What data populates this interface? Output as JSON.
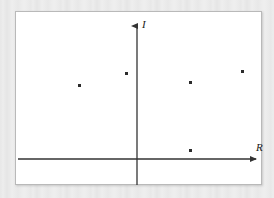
{
  "figure": {
    "kind": "complex-plane-scatter",
    "background_color": "#ebebeb",
    "panel_color": "#ffffff",
    "panel_border_color": "#b9b9b9",
    "axis_color": "#333333",
    "point_color": "#2b2b2b"
  },
  "axes": {
    "vertical": {
      "label": "I",
      "name": "imaginary-axis",
      "arrow": "up",
      "x_px": 121,
      "top_px": 7,
      "bottom_px": 173
    },
    "horizontal": {
      "label": "R",
      "name": "real-axis",
      "arrow": "right",
      "y_px": 147,
      "left_px": 2,
      "right_px": 243
    }
  },
  "chart_data": {
    "type": "scatter",
    "title": "",
    "xlabel": "R",
    "ylabel": "I",
    "grid": false,
    "legend": null,
    "axis_style": "arrow-axes-through-origin",
    "origin_px": {
      "x": 121,
      "y": 147
    },
    "points_px": [
      {
        "x": 63,
        "y": 73
      },
      {
        "x": 110,
        "y": 61
      },
      {
        "x": 174,
        "y": 70
      },
      {
        "x": 226,
        "y": 59
      },
      {
        "x": 174,
        "y": 138
      }
    ],
    "x": [
      -58,
      -11,
      53,
      105,
      53
    ],
    "y": [
      74,
      86,
      77,
      88,
      9
    ],
    "point_count": 5
  }
}
